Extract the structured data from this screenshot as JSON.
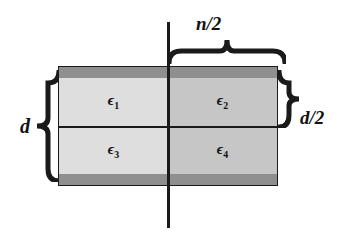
{
  "figure": {
    "name": "dielectric-slab-quadrants-diagram",
    "background_color": "#ffffff",
    "line_color": "#1a1a1a"
  },
  "slab": {
    "fill_left": "#dedede",
    "fill_right": "#c6c6c6",
    "plate_color": "#8f8f8f",
    "quadrants": [
      {
        "id": "epsilon-1",
        "symbol": "ϵ",
        "subscript": "1",
        "position": "top-left"
      },
      {
        "id": "epsilon-2",
        "symbol": "ϵ",
        "subscript": "2",
        "position": "top-right"
      },
      {
        "id": "epsilon-3",
        "symbol": "ϵ",
        "subscript": "3",
        "position": "bottom-left"
      },
      {
        "id": "epsilon-4",
        "symbol": "ϵ",
        "subscript": "4",
        "position": "bottom-right"
      }
    ]
  },
  "dimensions": {
    "top": "n/2",
    "left": "d",
    "right": "d/2"
  }
}
